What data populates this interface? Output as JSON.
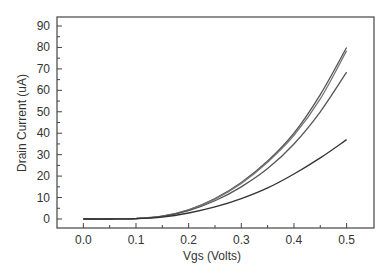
{
  "chart_data": {
    "type": "line",
    "title": "",
    "xlabel": "Vgs (Volts)",
    "ylabel": "Drain Current (uA)",
    "xlim": [
      -0.05,
      0.552
    ],
    "ylim": [
      -4.2,
      94.2
    ],
    "grid": false,
    "legend": null,
    "x_ticks": [
      0.0,
      0.1,
      0.2,
      0.3,
      0.4,
      0.5
    ],
    "x_tick_labels": [
      "0.0",
      "0.1",
      "0.2",
      "0.3",
      "0.4",
      "0.5"
    ],
    "y_ticks": [
      0,
      10,
      20,
      30,
      40,
      50,
      60,
      70,
      80,
      90
    ],
    "y_tick_labels": [
      "0",
      "10",
      "20",
      "30",
      "40",
      "50",
      "60",
      "70",
      "80",
      "90"
    ],
    "x": [
      0.0,
      0.05,
      0.1,
      0.15,
      0.2,
      0.25,
      0.3,
      0.35,
      0.4,
      0.45,
      0.5
    ],
    "series": [
      {
        "name": "curve-1",
        "color": "#555555",
        "values": [
          0,
          0,
          0.2,
          1.3,
          4.3,
          9.5,
          17.0,
          27.0,
          40.0,
          58.0,
          80.0
        ]
      },
      {
        "name": "curve-2",
        "color": "#777777",
        "values": [
          0,
          0,
          0.2,
          1.3,
          4.2,
          9.3,
          16.6,
          26.5,
          39.0,
          56.0,
          78.5
        ]
      },
      {
        "name": "curve-3",
        "color": "#555555",
        "values": [
          0,
          0,
          0.2,
          1.2,
          3.9,
          8.5,
          15.0,
          23.5,
          35.0,
          50.0,
          68.5
        ]
      },
      {
        "name": "curve-4",
        "color": "#333333",
        "values": [
          0,
          0,
          0.15,
          0.9,
          2.8,
          5.6,
          9.5,
          14.5,
          21.0,
          28.5,
          37.0
        ]
      }
    ]
  },
  "axes": {
    "x_title": "Vgs (Volts)",
    "y_title": "Drain Current (uA)"
  }
}
